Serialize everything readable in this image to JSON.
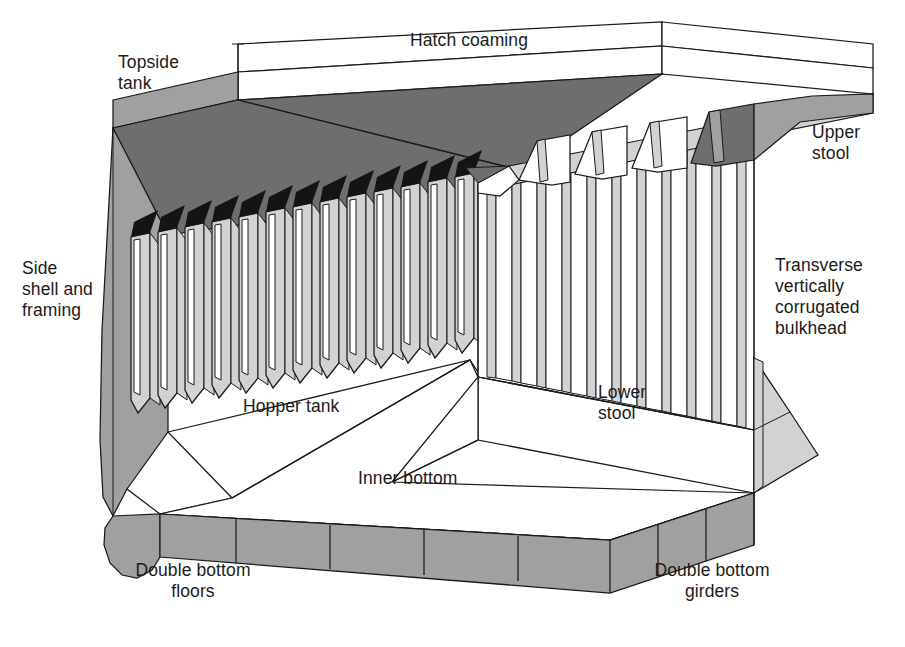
{
  "diagram": {
    "type": "technical-cutaway-isometric",
    "background_color": "#ffffff",
    "line_color": "#1a1a1a",
    "palette": {
      "white": "#ffffff",
      "light_gray": "#d2d2d2",
      "mid_gray": "#a0a0a0",
      "dark_gray": "#6e6e6e",
      "black": "#141414"
    }
  },
  "labels": [
    {
      "id": "topside-tank",
      "text": "Topside\ntank",
      "x": 118,
      "y": 52,
      "align": "left"
    },
    {
      "id": "hatch-coaming",
      "text": "Hatch coaming",
      "x": 410,
      "y": 30,
      "align": "left"
    },
    {
      "id": "upper-stool",
      "text": "Upper\nstool",
      "x": 812,
      "y": 122,
      "align": "left"
    },
    {
      "id": "transverse-bulkhead",
      "text": "Transverse\nvertically\ncorrugated\nbulkhead",
      "x": 775,
      "y": 255,
      "align": "left"
    },
    {
      "id": "side-shell-framing",
      "text": "Side\nshell and\nframing",
      "x": 22,
      "y": 258,
      "align": "left"
    },
    {
      "id": "hopper-tank",
      "text": "Hopper tank",
      "x": 243,
      "y": 396,
      "align": "left"
    },
    {
      "id": "lower-stool",
      "text": "Lower\nstool",
      "x": 598,
      "y": 382,
      "align": "left"
    },
    {
      "id": "inner-bottom",
      "text": "Inner bottom",
      "x": 358,
      "y": 468,
      "align": "left"
    },
    {
      "id": "double-bottom-floors",
      "text": "Double bottom\nfloors",
      "x": 118,
      "y": 560,
      "align": "left"
    },
    {
      "id": "double-bottom-girders",
      "text": "Double bottom\ngirders",
      "x": 637,
      "y": 560,
      "align": "left"
    }
  ],
  "components": [
    {
      "id": "hatch-coaming",
      "name": "Hatch coaming",
      "fill": "#ffffff"
    },
    {
      "id": "topside-tank",
      "name": "Topside tank",
      "fill": "#6e6e6e"
    },
    {
      "id": "side-shell",
      "name": "Side shell and framing",
      "fill": "#a0a0a0"
    },
    {
      "id": "side-frames",
      "name": "Side frames",
      "fill": "#d2d2d2"
    },
    {
      "id": "hopper-tank",
      "name": "Hopper tank",
      "fill": "#ffffff"
    },
    {
      "id": "inner-bottom",
      "name": "Inner bottom",
      "fill": "#ffffff"
    },
    {
      "id": "double-bottom-floors",
      "name": "Double bottom floors",
      "fill": "#a0a0a0"
    },
    {
      "id": "double-bottom-girders",
      "name": "Double bottom girders",
      "fill": "#a0a0a0"
    },
    {
      "id": "corrugated-bulkhead",
      "name": "Transverse vertically corrugated bulkhead",
      "fill": "#ffffff"
    },
    {
      "id": "upper-stool",
      "name": "Upper stool",
      "fill": "#6e6e6e"
    },
    {
      "id": "lower-stool",
      "name": "Lower stool",
      "fill": "#ffffff"
    }
  ],
  "counts": {
    "side_frames": 13,
    "bulkhead_corrugations": 11,
    "double_bottom_floor_panels": 4,
    "double_bottom_girder_panels": 4,
    "upper_stool_brackets": 5
  }
}
